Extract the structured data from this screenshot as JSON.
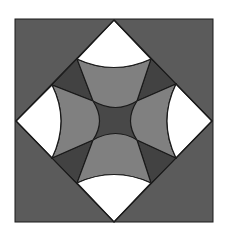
{
  "figure": {
    "colors": {
      "background": "#ffffff",
      "outer_square": "#5b5b5b",
      "white_wedges": "#ffffff",
      "petals": "#808080",
      "dark_triangles": "#424242",
      "center": "#484848",
      "stroke": "#1a1a1a"
    }
  }
}
